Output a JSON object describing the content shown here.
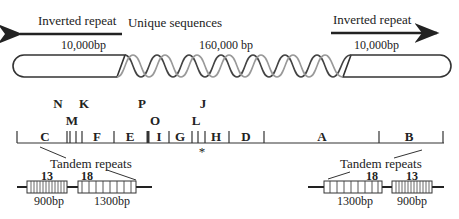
{
  "top": {
    "left_arrow_label": "Inverted repeat",
    "left_size": "10,000bp",
    "center_label": "Unique sequences",
    "center_size": "160,000 bp",
    "right_arrow_label": "Inverted repeat",
    "right_size": "10,000bp"
  },
  "map": {
    "upper_labels": [
      "N",
      "K",
      "P",
      "J"
    ],
    "middle_labels": [
      "M",
      "O",
      "L"
    ],
    "segments": [
      "C",
      "F",
      "E",
      "I",
      "G",
      "H",
      "D",
      "A",
      "B"
    ],
    "marker": "*"
  },
  "left_repeats": {
    "title": "Tandem repeats",
    "block1_count": "13",
    "block1_size": "900bp",
    "block2_count": "18",
    "block2_size": "1300bp"
  },
  "right_repeats": {
    "title": "Tandem repeats",
    "block1_count": "18",
    "block1_size": "1300bp",
    "block2_count": "13",
    "block2_size": "900bp"
  },
  "colors": {
    "line": "#222222",
    "helix_dark": "#444444",
    "helix_light": "#888888"
  }
}
